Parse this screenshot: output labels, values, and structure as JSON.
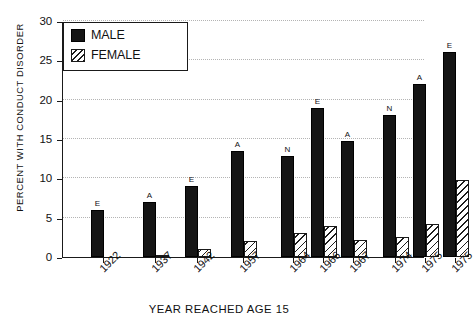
{
  "chart_data": {
    "type": "bar",
    "title": "",
    "xlabel": "YEAR REACHED AGE 15",
    "ylabel": "PERCENT WITH CONDUCT DISORDER",
    "ylim": [
      0,
      30
    ],
    "yticks": [
      0,
      5,
      10,
      15,
      20,
      25,
      30
    ],
    "grid": "horizontal-dotted",
    "legend_position": "top-left",
    "categories": [
      "1922",
      "1937",
      "1942",
      "1957",
      "1964",
      "1966",
      "1967",
      "1974",
      "1975",
      "1975"
    ],
    "annotations": [
      "E",
      "A",
      "E",
      "A",
      "N",
      "E",
      "A",
      "N",
      "A",
      "E"
    ],
    "series": [
      {
        "name": "MALE",
        "color": "#151515",
        "fill": "solid",
        "values": [
          6.0,
          7.0,
          9.0,
          13.5,
          12.8,
          19.0,
          14.8,
          18.0,
          22.0,
          26.0
        ]
      },
      {
        "name": "FEMALE",
        "color": "#ffffff",
        "fill": "diagonal-hatch",
        "values": [
          0.0,
          0.2,
          1.0,
          2.0,
          3.0,
          4.0,
          2.2,
          2.6,
          4.2,
          9.8
        ]
      }
    ],
    "group_offsets_px": [
      28,
      80,
      122,
      168,
      218,
      248,
      278,
      320,
      350,
      380
    ],
    "bar_width_px": 13
  },
  "legend": {
    "items": [
      {
        "label": "MALE",
        "swatch": "solid-black-square"
      },
      {
        "label": "FEMALE",
        "swatch": "hatched-square"
      }
    ]
  }
}
